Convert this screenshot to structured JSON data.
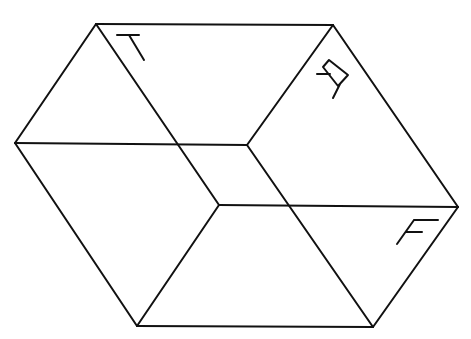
{
  "figure": {
    "type": "line-drawing",
    "stroke_color": "#111111",
    "background_color": "#ffffff"
  },
  "vertices": {
    "top_left": [
      96,
      24
    ],
    "top_right": [
      333,
      25
    ],
    "right": [
      458,
      207
    ],
    "bottom_right": [
      373,
      327
    ],
    "bottom_left": [
      137,
      326
    ],
    "left": [
      15,
      143
    ],
    "inner_upper": [
      247,
      145
    ],
    "inner_lower": [
      219,
      205
    ]
  },
  "edges": [
    {
      "name": "outer-top",
      "from": "top_left",
      "to": "top_right"
    },
    {
      "name": "outer-upper-right",
      "from": "top_right",
      "to": "right"
    },
    {
      "name": "outer-lower-right",
      "from": "right",
      "to": "bottom_right"
    },
    {
      "name": "outer-bottom",
      "from": "bottom_right",
      "to": "bottom_left"
    },
    {
      "name": "outer-lower-left",
      "from": "bottom_left",
      "to": "left"
    },
    {
      "name": "outer-upper-left",
      "from": "left",
      "to": "top_left"
    },
    {
      "name": "inner-upper-horizontal",
      "from": "left",
      "to": "inner_upper"
    },
    {
      "name": "inner-upper-diagonal",
      "from": "inner_upper",
      "to": "top_right"
    },
    {
      "name": "inner-long-diagonal-a",
      "from": "top_left",
      "to": "inner_lower"
    },
    {
      "name": "inner-long-diagonal-b",
      "from": "inner_upper",
      "to": "bottom_right"
    },
    {
      "name": "inner-lower-horizontal",
      "from": "inner_lower",
      "to": "right"
    },
    {
      "name": "inner-lower-diagonal",
      "from": "inner_lower",
      "to": "bottom_left"
    }
  ],
  "labels": {
    "top_face": "T",
    "right_upper_face": "A",
    "right_lower_face": "F"
  }
}
